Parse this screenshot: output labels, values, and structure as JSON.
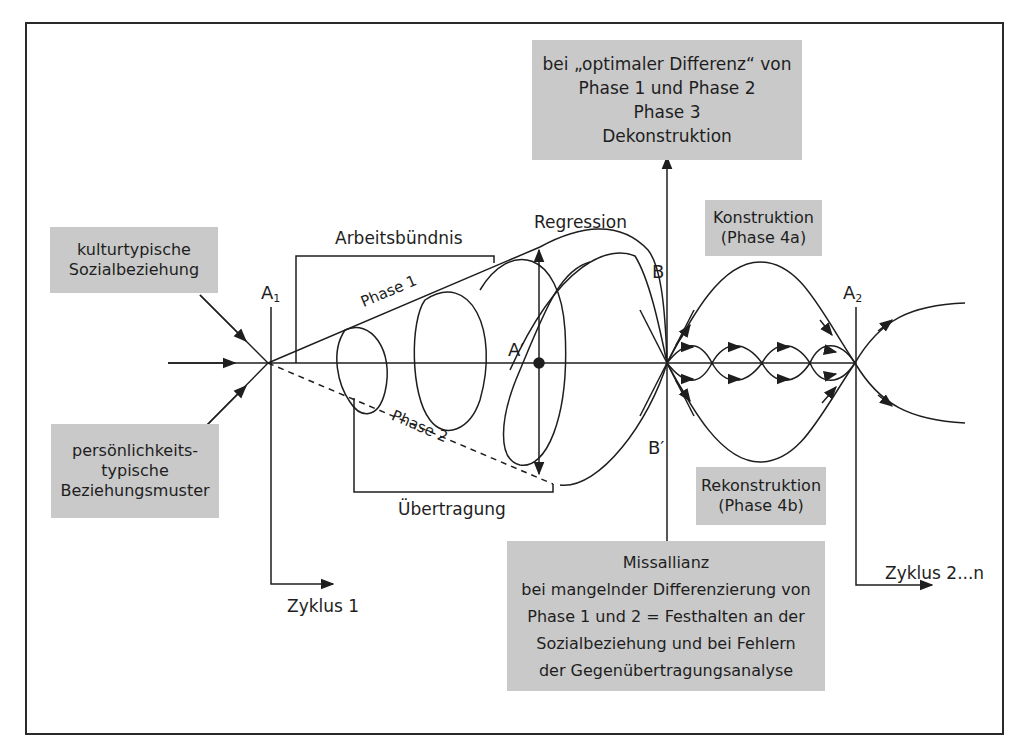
{
  "diagram": {
    "boxes": {
      "kulturtypisch": {
        "lines": [
          "kulturtypische",
          "Sozialbeziehung"
        ]
      },
      "persoenlichkeit": {
        "lines": [
          "persönlichkeits-",
          "typische",
          "Beziehungsmuster"
        ]
      },
      "dekonstruktion": {
        "lines": [
          "bei „optimaler Differenz“ von",
          "Phase 1 und Phase 2",
          "Phase 3",
          "Dekonstruktion"
        ]
      },
      "konstruktion": {
        "lines": [
          "Konstruktion",
          "(Phase 4a)"
        ]
      },
      "rekonstruktion": {
        "lines": [
          "Rekonstruktion",
          "(Phase 4b)"
        ]
      },
      "missallianz": {
        "lines": [
          "Missallianz",
          "bei mangelnder Differenzierung von",
          "Phase 1 und 2 = Festhalten an der",
          "Sozialbeziehung und bei Fehlern",
          "der Gegenübertragungsanalyse"
        ]
      }
    },
    "labels": {
      "a1_main": "A",
      "a1_sub": "1",
      "a2_main": "A",
      "a2_sub": "2",
      "a_prime": "A′",
      "b": "B",
      "b_prime": "B′",
      "arbeitsbuendnis": "Arbeitsbündnis",
      "uebertragung": "Übertragung",
      "regression": "Regression",
      "phase1": "Phase 1",
      "phase2": "Phase 2",
      "zyklus1": "Zyklus 1",
      "zyklus2n": "Zyklus 2...n"
    },
    "colors": {
      "box_fill": "#c9c9c9",
      "line": "#1e1e1e",
      "frame": "#2a2a2a"
    }
  }
}
